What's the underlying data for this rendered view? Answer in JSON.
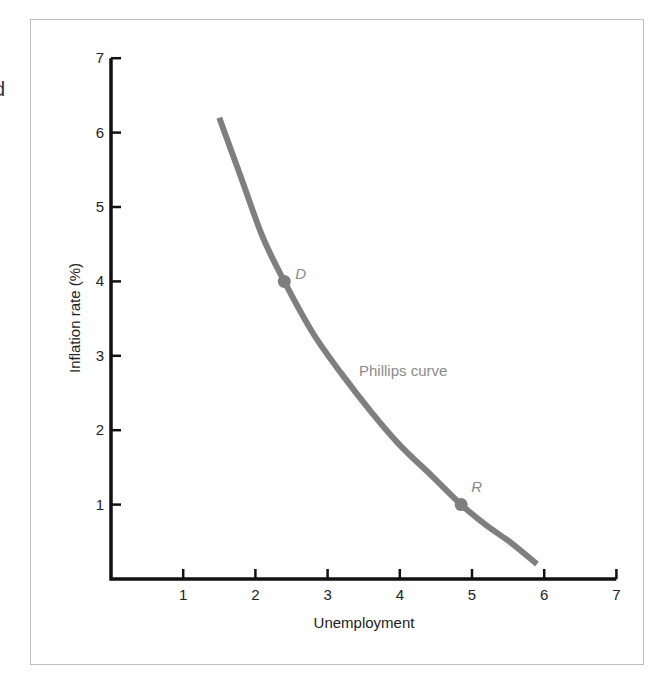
{
  "page": {
    "edge_fragment": "d"
  },
  "chart_data": {
    "type": "line",
    "title": "",
    "xlabel": "Unemployment",
    "ylabel": "Inflation rate (%)",
    "xlim": [
      0,
      7
    ],
    "ylim": [
      0,
      7
    ],
    "x_ticks": [
      "1",
      "2",
      "3",
      "4",
      "5",
      "6",
      "7"
    ],
    "y_ticks": [
      "1",
      "2",
      "3",
      "4",
      "5",
      "6",
      "7"
    ],
    "grid": false,
    "legend": null,
    "series": [
      {
        "name": "Phillips curve",
        "color": "#7f7f7f",
        "points": [
          [
            1.5,
            6.2
          ],
          [
            1.8,
            5.4
          ],
          [
            2.1,
            4.6
          ],
          [
            2.4,
            4.0
          ],
          [
            2.8,
            3.3
          ],
          [
            3.2,
            2.75
          ],
          [
            3.6,
            2.25
          ],
          [
            4.0,
            1.8
          ],
          [
            4.45,
            1.38
          ],
          [
            4.85,
            1.0
          ],
          [
            5.2,
            0.72
          ],
          [
            5.55,
            0.48
          ],
          [
            5.9,
            0.2
          ]
        ]
      }
    ],
    "annotations": [
      {
        "label": "D",
        "x": 2.4,
        "y": 4.0
      },
      {
        "label": "R",
        "x": 4.85,
        "y": 1.0
      },
      {
        "label": "Phillips curve",
        "x": 3.4,
        "y": 2.85
      }
    ],
    "colors": {
      "axis": "#111111",
      "curve": "#7f7f7f",
      "label_gray": "#8a8a8a",
      "frame": "#bdbdbd"
    }
  }
}
